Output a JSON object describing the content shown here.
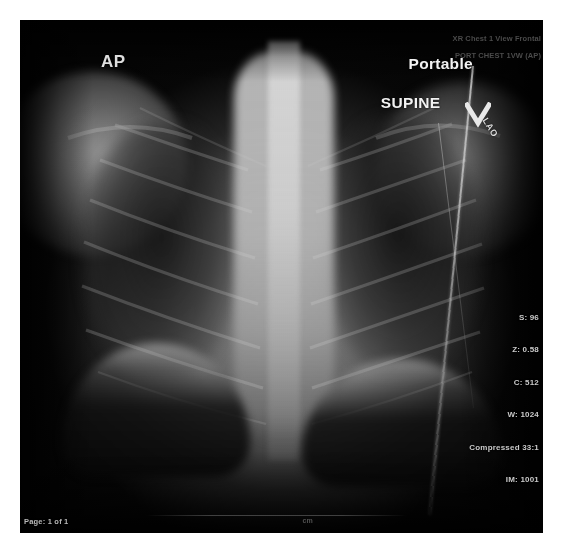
{
  "viewer": {
    "background_color": "#ffffff",
    "image_background_color": "#050505"
  },
  "image": {
    "modality": "radiograph",
    "body_part": "chest",
    "annotations": {
      "laterality_projection_marker": "AP",
      "position_line_1": "Portable",
      "position_line_2": "SUPINE",
      "obliquity_marker": "LAO"
    },
    "study_header": {
      "line_1": "XR Chest 1 View Frontal",
      "line_2": "PORT CHEST 1VW (AP)"
    },
    "technical_readout": {
      "series_label": "S: 96",
      "zoom_label": "Z: 0.58",
      "window_center_label": "C: 512",
      "window_width_label": "W: 1024",
      "compression_label": "Compressed 33:1",
      "image_label": "IM: 1001"
    },
    "scale_label": "cm",
    "page_indicator": "Page: 1 of 1"
  }
}
